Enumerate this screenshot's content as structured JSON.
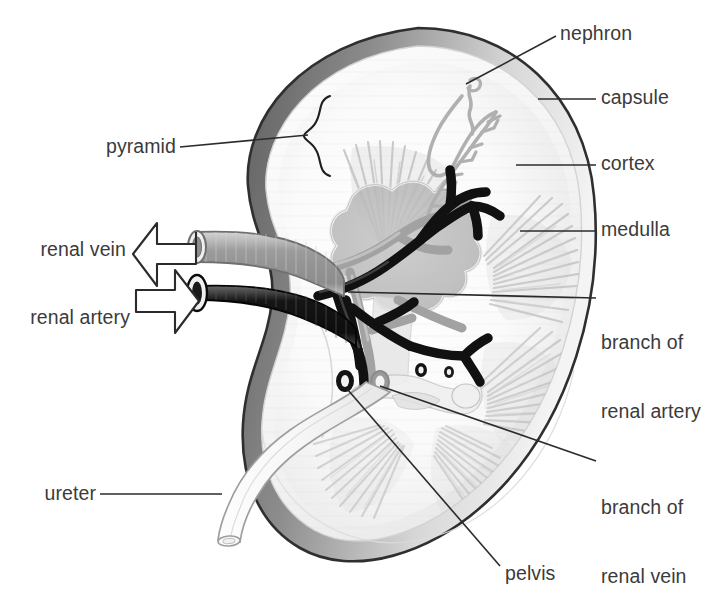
{
  "diagram": {
    "background_color": "#ffffff",
    "text_color": "#3b3b3b",
    "leader_line_color": "#2b2b2b"
  },
  "labels": {
    "nephron": "nephron",
    "capsule": "capsule",
    "cortex": "cortex",
    "medulla": "medulla",
    "branch_of_renal_artery_l1": "branch of",
    "branch_of_renal_artery_l2": "renal artery",
    "branch_of_renal_vein_l1": "branch of",
    "branch_of_renal_vein_l2": "renal vein",
    "pelvis": "pelvis",
    "ureter": "ureter",
    "renal_vein": "renal vein",
    "renal_artery": "renal artery",
    "pyramid": "pyramid"
  },
  "structures": {
    "capsule": {
      "name": "capsule",
      "color": "#6e6e6e",
      "note": "dark outer rim, thickest upper-left"
    },
    "cortex": {
      "name": "cortex",
      "color": "#f2f2f2",
      "note": "pale outer parenchyma"
    },
    "medulla": {
      "name": "medulla",
      "color": "#c9c9c9",
      "note": "striated pyramids, fan of radiating tubules"
    },
    "pyramid": {
      "name": "pyramid",
      "color": "#bdbdbd",
      "marker": "curly-brace"
    },
    "nephron": {
      "name": "nephron",
      "color": "#b4b4b4",
      "note": "looping tubule with loop of Henle"
    },
    "pelvis": {
      "name": "pelvis",
      "color": "#d9d9d9",
      "note": "star-shaped collecting chamber"
    },
    "renal_artery": {
      "name": "renal artery",
      "color": "#1c1c1c",
      "direction": "inflow"
    },
    "renal_vein": {
      "name": "renal vein",
      "color": "#9a9a9a",
      "direction": "outflow"
    },
    "ureter": {
      "name": "ureter",
      "color": "#fbfbfb",
      "note": "tube exiting to lower left"
    }
  },
  "flow_arrows": [
    {
      "name": "renal-vein-arrow",
      "points_to": "left",
      "meaning": "blood leaves kidney"
    },
    {
      "name": "renal-artery-arrow",
      "points_to": "right",
      "meaning": "blood enters kidney"
    }
  ]
}
